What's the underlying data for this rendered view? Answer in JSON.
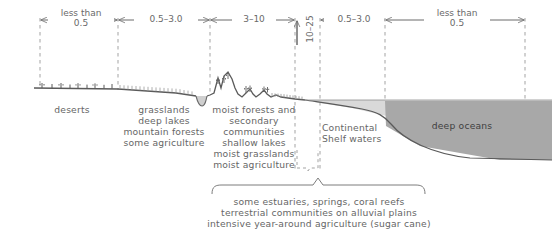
{
  "figure": {
    "type": "cross-section-diagram",
    "colors": {
      "line": "#5f5f5f",
      "dash": "#9a9a9a",
      "text": "#666666",
      "shelf_water": "#d9d9d9",
      "deep_ocean": "#a8a8a8",
      "background": "#ffffff"
    }
  },
  "scale": {
    "units_note": "",
    "segments": [
      {
        "id": "seg-desert",
        "label": "less than\n0.5",
        "x_start": 40,
        "x_end": 118,
        "orientation": "horizontal"
      },
      {
        "id": "seg-grassland",
        "label": "0.5–3.0",
        "x_start": 118,
        "x_end": 210,
        "orientation": "horizontal"
      },
      {
        "id": "seg-forest",
        "label": "3–10",
        "x_start": 210,
        "x_end": 295,
        "orientation": "horizontal"
      },
      {
        "id": "seg-coast",
        "label": "10–25",
        "x_start": 295,
        "x_end": 320,
        "orientation": "vertical"
      },
      {
        "id": "seg-shelf",
        "label": "0.5–3.0",
        "x_start": 320,
        "x_end": 385,
        "orientation": "horizontal"
      },
      {
        "id": "seg-ocean",
        "label": "less than\n0.5",
        "x_start": 385,
        "x_end": 525,
        "orientation": "horizontal"
      }
    ]
  },
  "zones": [
    {
      "id": "zone-deserts",
      "label": "deserts",
      "x": 72,
      "y": 108,
      "terrain": "flat plain with scattered cactus symbols"
    },
    {
      "id": "zone-grasslands",
      "label": "grasslands\ndeep lakes\nmountain forests\nsome agriculture",
      "x": 164,
      "y": 108,
      "terrain": "gentle slope with hatching"
    },
    {
      "id": "zone-moist-forests",
      "label": "moist forests and\nsecondary\ncommunities\nshallow lakes\nmoist grasslands\nmoist agriculture",
      "x": 254,
      "y": 108,
      "terrain": "mountain peaks with conifer symbols descending to coast"
    },
    {
      "id": "zone-continental-shelf",
      "label": "Continental\nShelf waters",
      "x": 352,
      "y": 130,
      "terrain": "shallow shelf water over gently sloping seabed"
    },
    {
      "id": "zone-deep-oceans",
      "label": "deep oceans",
      "x": 462,
      "y": 126,
      "terrain": "deep water body beyond the shelf break"
    }
  ],
  "caption": {
    "id": "caption-bracket",
    "bracket_x_start": 212,
    "bracket_x_end": 425,
    "bracket_tick_x": 318,
    "lines": [
      "some estuaries, springs, coral reefs",
      "terrestrial communities on alluvial plains",
      "intensive year-around agriculture (sugar cane)"
    ]
  }
}
